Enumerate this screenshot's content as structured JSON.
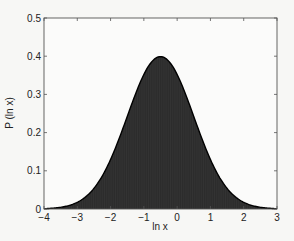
{
  "chart_data": {
    "type": "area",
    "title": "",
    "xlabel": "ln x",
    "ylabel": "P (ln x)",
    "xlim": [
      -4,
      3
    ],
    "ylim": [
      0,
      0.5
    ],
    "xticks": [
      -4,
      -3,
      -2,
      -1,
      0,
      1,
      2,
      3
    ],
    "yticks": [
      0,
      0.1,
      0.2,
      0.3,
      0.4,
      0.5
    ],
    "ytick_labels": [
      "0",
      "0.1",
      "0.2",
      "0.3",
      "0.4",
      "0.5"
    ],
    "grid": false,
    "legend": null,
    "series": [
      {
        "name": "P (ln x)",
        "description": "Gaussian density in ln x, mean -0.5, std dev 1, filled dark gray under curve",
        "mean": -0.5,
        "std": 1,
        "x": [
          -4,
          -3.5,
          -3,
          -2.5,
          -2,
          -1.5,
          -1,
          -0.5,
          0,
          0.5,
          1,
          1.5,
          2,
          2.5,
          3
        ],
        "values": [
          0.001,
          0.004,
          0.018,
          0.054,
          0.13,
          0.242,
          0.352,
          0.399,
          0.352,
          0.242,
          0.13,
          0.054,
          0.018,
          0.004,
          0.001
        ]
      }
    ],
    "colors": {
      "fill": "#333333",
      "line": "#000000",
      "axes": "#555555",
      "background": "#f7f7f5"
    }
  }
}
